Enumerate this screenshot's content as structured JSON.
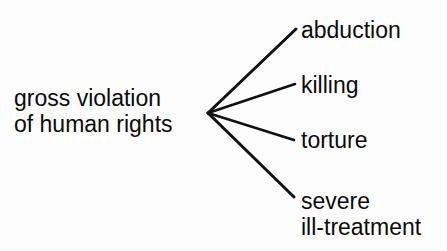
{
  "diagram": {
    "type": "fan-tree",
    "background_color": "#fdfdfd",
    "line_color": "#111111",
    "text_color": "#0a0a0a",
    "root": {
      "label_line1": "gross violation",
      "label_line2": "of human rights",
      "label_full": "gross violation of human rights"
    },
    "vertex": {
      "x": 208,
      "y": 113
    },
    "leaves": [
      {
        "label_line1": "abduction",
        "label_line2": "",
        "label_full": "abduction",
        "edge_end": {
          "x": 296,
          "y": 29
        }
      },
      {
        "label_line1": "killing",
        "label_line2": "",
        "label_full": "killing",
        "edge_end": {
          "x": 295,
          "y": 84
        }
      },
      {
        "label_line1": "torture",
        "label_line2": "",
        "label_full": "torture",
        "edge_end": {
          "x": 294,
          "y": 140
        }
      },
      {
        "label_line1": "severe",
        "label_line2": "ill-treatment",
        "label_full": "severe ill-treatment",
        "edge_end": {
          "x": 294,
          "y": 197
        }
      }
    ]
  }
}
